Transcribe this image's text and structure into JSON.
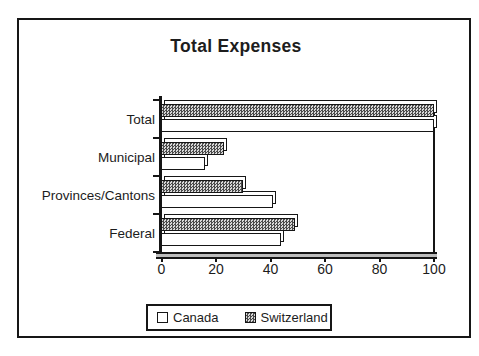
{
  "title": "Total Expenses",
  "chart_data": {
    "type": "bar",
    "orientation": "horizontal",
    "title": "Total Expenses",
    "categories": [
      "Total",
      "Municipal",
      "Provinces/Cantons",
      "Federal"
    ],
    "series": [
      {
        "name": "Canada",
        "style": "plain",
        "values": [
          100,
          16,
          41,
          44
        ]
      },
      {
        "name": "Switzerland",
        "style": "hatch",
        "values": [
          100,
          23,
          30,
          49
        ]
      }
    ],
    "row_order_top_to_bottom": [
      "Switzerland",
      "Canada"
    ],
    "xlabel": "",
    "ylabel": "",
    "xlim": [
      0,
      100
    ],
    "xticks": [
      0,
      20,
      40,
      60,
      80,
      100
    ],
    "grid": false,
    "legend_position": "bottom"
  },
  "legend": {
    "items": [
      {
        "label": "Canada",
        "swatch": "white-square"
      },
      {
        "label": "Switzerland",
        "swatch": "hatched-square"
      }
    ]
  },
  "colors": {
    "line": "#161616",
    "text": "#1c1c1c",
    "bar_canada_fill": "#ffffff",
    "bar_switzerland_dark": "#4a4a4a",
    "bar_switzerland_light": "#d8d8d8",
    "floor_fill": "#bdbdbd",
    "background": "#ffffff"
  }
}
